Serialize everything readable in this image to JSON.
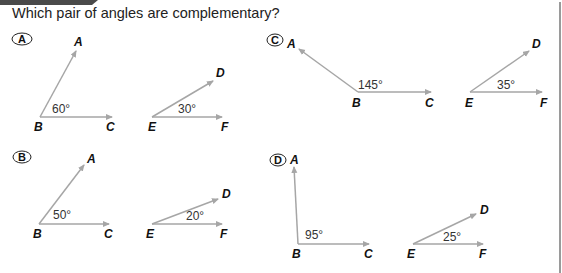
{
  "question": "Which pair of angles are complementary?",
  "colors": {
    "ray": "#a6a6a6",
    "tab": "#4a4a4a",
    "border": "#9a9a9a"
  },
  "options": [
    {
      "letter": "A",
      "angles": [
        {
          "vertex": "B",
          "ray1": "A",
          "ray2": "C",
          "measure": "60°"
        },
        {
          "vertex": "E",
          "ray1": "D",
          "ray2": "F",
          "measure": "30°"
        }
      ]
    },
    {
      "letter": "B",
      "angles": [
        {
          "vertex": "B",
          "ray1": "A",
          "ray2": "C",
          "measure": "50°"
        },
        {
          "vertex": "E",
          "ray1": "D",
          "ray2": "F",
          "measure": "20°"
        }
      ]
    },
    {
      "letter": "C",
      "angles": [
        {
          "vertex": "B",
          "ray1": "A",
          "ray2": "C",
          "measure": "145°"
        },
        {
          "vertex": "E",
          "ray1": "D",
          "ray2": "F",
          "measure": "35°"
        }
      ]
    },
    {
      "letter": "D",
      "angles": [
        {
          "vertex": "B",
          "ray1": "A",
          "ray2": "C",
          "measure": "95°"
        },
        {
          "vertex": "E",
          "ray1": "D",
          "ray2": "F",
          "measure": "25°"
        }
      ]
    }
  ]
}
